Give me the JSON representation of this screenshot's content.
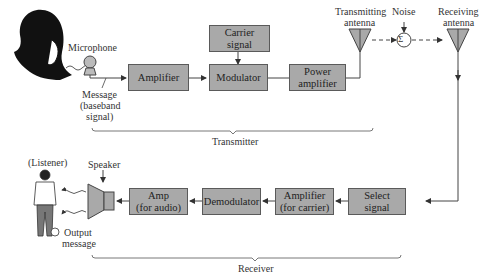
{
  "diagram": {
    "colors": {
      "block_fill": "#a9a9a9",
      "block_border": "#5a5a5a",
      "line": "#444444",
      "background": "#ffffff"
    },
    "transmitter": {
      "source_label": "Microphone",
      "message_label_line1": "Message",
      "message_label_line2": "(baseband",
      "message_label_line3": "signal)",
      "blocks": {
        "amplifier": "Amplifier",
        "carrier_line1": "Carrier",
        "carrier_line2": "signal",
        "modulator": "Modulator",
        "power_amp_line1": "Power",
        "power_amp_line2": "amplifier"
      },
      "brace_label": "Transmitter"
    },
    "channel": {
      "tx_antenna_line1": "Transmitting",
      "tx_antenna_line2": "antenna",
      "noise_label": "Noise",
      "sum_symbol": "Σ",
      "rx_antenna_line1": "Receiving",
      "rx_antenna_line2": "antenna"
    },
    "receiver": {
      "blocks": {
        "select_line1": "Select",
        "select_line2": "signal",
        "amp_carrier_line1": "Amplifier",
        "amp_carrier_line2": "(for carrier)",
        "demodulator": "Demodulator",
        "amp_audio_line1": "Amp",
        "amp_audio_line2": "(for audio)"
      },
      "speaker_label": "Speaker",
      "listener_label": "(Listener)",
      "output_line1": "Output",
      "output_line2": "message",
      "brace_label": "Receiver"
    }
  }
}
